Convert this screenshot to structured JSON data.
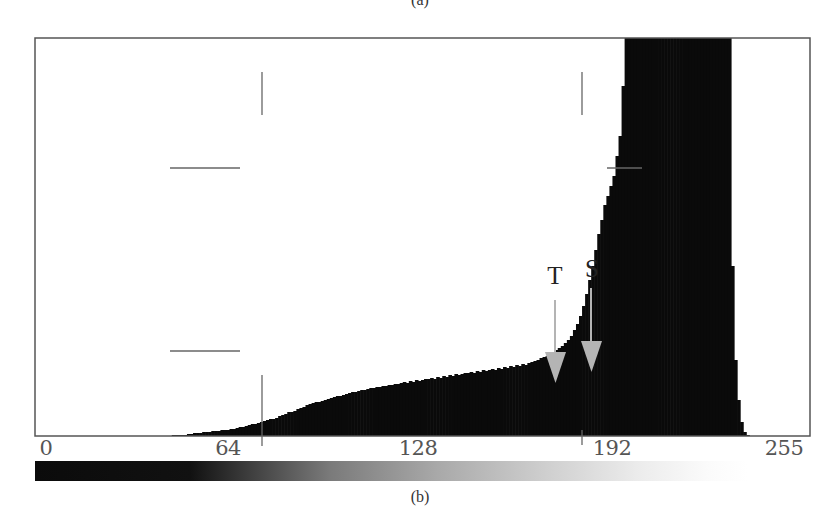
{
  "captions": {
    "top": "(a)",
    "bottom": "(b)"
  },
  "chart_data": {
    "type": "bar",
    "title": "",
    "xlabel": "",
    "ylabel": "",
    "x_ticks": [
      0,
      64,
      128,
      192,
      255
    ],
    "xlim": [
      0,
      255
    ],
    "ylim_px": [
      0,
      398
    ],
    "grid": false,
    "legend": null,
    "bins": [
      0,
      1,
      2,
      3,
      4,
      5,
      6,
      7,
      8,
      9,
      10,
      11,
      12,
      13,
      14,
      15,
      16,
      17,
      18,
      19,
      20,
      21,
      22,
      23,
      24,
      25,
      26,
      27,
      28,
      29,
      30,
      31,
      32,
      33,
      34,
      35,
      36,
      37,
      38,
      39,
      40,
      41,
      42,
      43,
      44,
      45,
      46,
      47,
      48,
      49,
      50,
      51,
      52,
      53,
      54,
      55,
      56,
      57,
      58,
      59,
      60,
      61,
      62,
      63,
      64,
      65,
      66,
      67,
      68,
      69,
      70,
      71,
      72,
      73,
      74,
      75,
      76,
      77,
      78,
      79,
      80,
      81,
      82,
      83,
      84,
      85,
      86,
      87,
      88,
      89,
      90,
      91,
      92,
      93,
      94,
      95,
      96,
      97,
      98,
      99,
      100,
      101,
      102,
      103,
      104,
      105,
      106,
      107,
      108,
      109,
      110,
      111,
      112,
      113,
      114,
      115,
      116,
      117,
      118,
      119,
      120,
      121,
      122,
      123,
      124,
      125,
      126,
      127,
      128,
      129,
      130,
      131,
      132,
      133,
      134,
      135,
      136,
      137,
      138,
      139,
      140,
      141,
      142,
      143,
      144,
      145,
      146,
      147,
      148,
      149,
      150,
      151,
      152,
      153,
      154,
      155,
      156,
      157,
      158,
      159,
      160,
      161,
      162,
      163,
      164,
      165,
      166,
      167,
      168,
      169,
      170,
      171,
      172,
      173,
      174,
      175,
      176,
      177,
      178,
      179,
      180,
      181,
      182,
      183,
      184,
      185,
      186,
      187,
      188,
      189,
      190,
      191,
      192,
      193,
      194,
      195,
      196,
      197,
      198,
      199,
      200,
      201,
      202,
      203,
      204,
      205,
      206,
      207,
      208,
      209,
      210,
      211,
      212,
      213,
      214,
      215,
      216,
      217,
      218,
      219,
      220,
      221,
      222,
      223,
      224,
      225,
      226,
      227,
      228,
      229,
      230,
      231,
      232,
      233,
      234,
      235,
      236,
      237,
      238,
      239,
      240,
      241,
      242,
      243,
      244,
      245,
      246,
      247,
      248,
      249,
      250,
      251,
      252,
      253,
      254,
      255
    ],
    "values": [
      0,
      0,
      0,
      0,
      0,
      0,
      0,
      0,
      0,
      0,
      0,
      0,
      0,
      0,
      0,
      0,
      0,
      0,
      0,
      0,
      0,
      0,
      0,
      0,
      0,
      0,
      0,
      0,
      0,
      0,
      0,
      0,
      0,
      0,
      0,
      0,
      0,
      0,
      0,
      0,
      0,
      0,
      0,
      0,
      0,
      1,
      1,
      1,
      1,
      1,
      2,
      2,
      3,
      3,
      3,
      4,
      4,
      4,
      5,
      5,
      5,
      6,
      6,
      6,
      7,
      7,
      8,
      9,
      9,
      10,
      11,
      12,
      12,
      13,
      14,
      15,
      16,
      17,
      17,
      18,
      20,
      21,
      22,
      24,
      24,
      25,
      27,
      28,
      29,
      31,
      32,
      33,
      34,
      34,
      35,
      36,
      37,
      38,
      39,
      40,
      40,
      41,
      42,
      43,
      44,
      44,
      45,
      46,
      46,
      47,
      48,
      48,
      49,
      49,
      50,
      50,
      51,
      51,
      52,
      52,
      53,
      54,
      53,
      55,
      54,
      56,
      55,
      56,
      57,
      57,
      58,
      57,
      59,
      58,
      60,
      59,
      61,
      60,
      62,
      61,
      62,
      63,
      63,
      64,
      63,
      65,
      64,
      66,
      65,
      66,
      67,
      66,
      68,
      67,
      69,
      68,
      70,
      69,
      71,
      70,
      72,
      71,
      73,
      74,
      75,
      76,
      78,
      79,
      80,
      82,
      84,
      86,
      88,
      90,
      93,
      96,
      100,
      106,
      112,
      120,
      130,
      142,
      156,
      170,
      186,
      202,
      216,
      231,
      240,
      250,
      260,
      280,
      300,
      350,
      398,
      398,
      398,
      398,
      398,
      398,
      398,
      398,
      398,
      398,
      398,
      398,
      398,
      398,
      398,
      398,
      398,
      398,
      398,
      398,
      398,
      398,
      398,
      398,
      398,
      398,
      398,
      398,
      398,
      398,
      398,
      398,
      398,
      398,
      398,
      170,
      76,
      36,
      14,
      4,
      1,
      0,
      0,
      0,
      0,
      0,
      0,
      0,
      0,
      0,
      0,
      0,
      0,
      0,
      0,
      0,
      0,
      0,
      0,
      0,
      0,
      0,
      0,
      0,
      0
    ],
    "clipped_peak_range": [
      200,
      234
    ],
    "annotations": [
      {
        "label": "T",
        "bin": 171,
        "type": "arrow-down"
      },
      {
        "label": "S",
        "bin": 183,
        "type": "arrow-down"
      }
    ],
    "colorbar": {
      "from": "#000000",
      "to": "#ffffff",
      "range": [
        0,
        255
      ]
    }
  },
  "axis": {
    "ticks": [
      {
        "label": "0",
        "x": 46
      },
      {
        "label": "64",
        "x": 228
      },
      {
        "label": "128",
        "x": 418
      },
      {
        "label": "192",
        "x": 612
      },
      {
        "label": "255",
        "x": 784
      }
    ]
  },
  "markers": {
    "T": {
      "label": "T",
      "x": 555
    },
    "S": {
      "label": "S",
      "x": 591
    }
  },
  "colors": {
    "bars": "#0a0a0a",
    "frame": "#555555",
    "arrows": "#b4b4b4",
    "crosshair": "#666666"
  }
}
